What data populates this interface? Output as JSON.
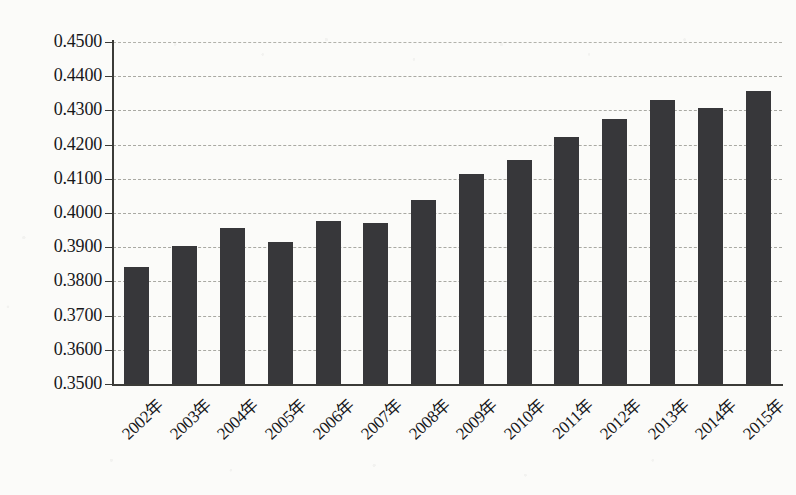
{
  "chart_data": {
    "type": "bar",
    "title": "",
    "subtitle": "",
    "xlabel": "",
    "ylabel": "",
    "categories": [
      "2002年",
      "2003年",
      "2004年",
      "2005年",
      "2006年",
      "2007年",
      "2008年",
      "2009年",
      "2010年",
      "2011年",
      "2012年",
      "2013年",
      "2014年",
      "2015年"
    ],
    "values": [
      0.3843,
      0.3905,
      0.3955,
      0.3915,
      0.3978,
      0.397,
      0.4038,
      0.4113,
      0.4155,
      0.4223,
      0.4275,
      0.433,
      0.4307,
      0.4357
    ],
    "ylim": [
      0.35,
      0.45
    ],
    "ytick_step": 0.01,
    "ytick_labels": [
      "0.4500",
      "0.4400",
      "0.4300",
      "0.4200",
      "0.4100",
      "0.4000",
      "0.3900",
      "0.3800",
      "0.3700",
      "0.3600",
      "0.3500"
    ],
    "ytick_values": [
      0.45,
      0.44,
      0.43,
      0.42,
      0.41,
      0.4,
      0.39,
      0.38,
      0.37,
      0.36,
      0.35
    ],
    "grid": true,
    "grid_style": "dashed-horizontal",
    "legend": false,
    "legend_position": "none",
    "bar_color": "#37373a",
    "axis_color": "#3b3b38",
    "gridline_color": "#a9a9a3",
    "background_color": "#fbfbf9",
    "xtick_rotation": -43,
    "series": [
      {
        "name": "",
        "values": [
          0.3843,
          0.3905,
          0.3955,
          0.3915,
          0.3978,
          0.397,
          0.4038,
          0.4113,
          0.4155,
          0.4223,
          0.4275,
          0.433,
          0.4307,
          0.4357
        ]
      }
    ]
  }
}
